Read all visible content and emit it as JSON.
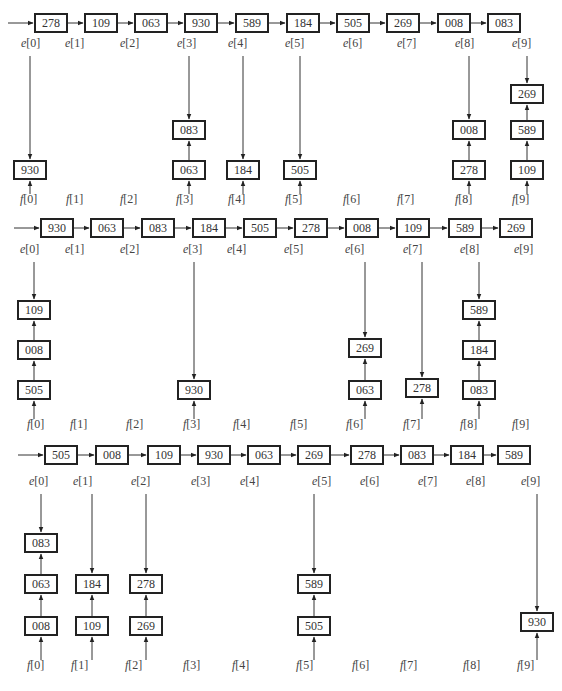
{
  "passes": [
    {
      "list": [
        "278",
        "109",
        "063",
        "930",
        "589",
        "184",
        "505",
        "269",
        "008",
        "083"
      ],
      "list_x": [
        34,
        84,
        134,
        184,
        235,
        286,
        336,
        386,
        437,
        487
      ],
      "list_y": 13,
      "e_label_x": [
        21,
        65,
        120,
        177,
        228,
        285,
        343,
        397,
        455,
        512
      ],
      "e_label_y": 36,
      "e_labels": [
        "e[0]",
        "e[1]",
        "e[2]",
        "e[3]",
        "e[4]",
        "e[5]",
        "e[6]",
        "e[7]",
        "e[8]",
        "e[9]"
      ],
      "f_labels": [
        "f[0]",
        "f[1]",
        "f[2]",
        "f[3]",
        "f[4]",
        "f[5]",
        "f[6]",
        "f[7]",
        "f[8]",
        "f[9]"
      ],
      "f_label_x": [
        20,
        66,
        120,
        176,
        228,
        285,
        343,
        397,
        455,
        512
      ],
      "f_label_y": 192,
      "buckets": [
        {
          "col": 0,
          "x": 13,
          "items": [
            {
              "v": "930",
              "y": 160
            }
          ]
        },
        {
          "col": 3,
          "x": 172,
          "items": [
            {
              "v": "063",
              "y": 160
            },
            {
              "v": "083",
              "y": 120
            }
          ]
        },
        {
          "col": 4,
          "x": 226,
          "items": [
            {
              "v": "184",
              "y": 160
            }
          ]
        },
        {
          "col": 5,
          "x": 283,
          "items": [
            {
              "v": "505",
              "y": 160
            }
          ]
        },
        {
          "col": 8,
          "x": 452,
          "items": [
            {
              "v": "278",
              "y": 160
            },
            {
              "v": "008",
              "y": 120
            }
          ]
        },
        {
          "col": 9,
          "x": 510,
          "items": [
            {
              "v": "109",
              "y": 160
            },
            {
              "v": "589",
              "y": 120
            },
            {
              "v": "269",
              "y": 84
            }
          ]
        }
      ]
    },
    {
      "list": [
        "930",
        "063",
        "083",
        "184",
        "505",
        "278",
        "008",
        "109",
        "589",
        "269"
      ],
      "list_x": [
        40,
        90,
        141,
        192,
        243,
        294,
        345,
        396,
        448,
        499
      ],
      "list_y": 218,
      "e_label_x": [
        20,
        65,
        120,
        183,
        227,
        284,
        345,
        403,
        460,
        514
      ],
      "e_label_y": 242,
      "e_labels": [
        "e[0]",
        "e[1]",
        "e[2]",
        "e[3]",
        "e[4]",
        "e[5]",
        "e[6]",
        "e[7]",
        "e[8]",
        "e[9]"
      ],
      "f_labels": [
        "f[0]",
        "f[1]",
        "f[2]",
        "f[3]",
        "f[4]",
        "f[5]",
        "f[6]",
        "f[7]",
        "f[8]",
        "f[9]"
      ],
      "f_label_x": [
        27,
        70,
        126,
        183,
        233,
        290,
        346,
        403,
        460,
        512
      ],
      "f_label_y": 417,
      "buckets": [
        {
          "col": 0,
          "x": 17,
          "items": [
            {
              "v": "505",
              "y": 380
            },
            {
              "v": "008",
              "y": 340
            },
            {
              "v": "109",
              "y": 300
            }
          ]
        },
        {
          "col": 3,
          "x": 177,
          "items": [
            {
              "v": "930",
              "y": 380
            }
          ]
        },
        {
          "col": 6,
          "x": 348,
          "items": [
            {
              "v": "063",
              "y": 380
            },
            {
              "v": "269",
              "y": 338
            }
          ]
        },
        {
          "col": 7,
          "x": 405,
          "items": [
            {
              "v": "278",
              "y": 378
            }
          ]
        },
        {
          "col": 8,
          "x": 462,
          "items": [
            {
              "v": "083",
              "y": 380
            },
            {
              "v": "184",
              "y": 340
            },
            {
              "v": "589",
              "y": 300
            }
          ]
        }
      ]
    },
    {
      "list": [
        "505",
        "008",
        "109",
        "930",
        "063",
        "269",
        "278",
        "083",
        "184",
        "589"
      ],
      "list_x": [
        44,
        95,
        147,
        197,
        247,
        297,
        350,
        400,
        450,
        497
      ],
      "list_y": 445,
      "e_label_x": [
        29,
        73,
        131,
        191,
        240,
        312,
        360,
        418,
        466,
        521
      ],
      "e_label_y": 474,
      "e_labels": [
        "e[0]",
        "e[1]",
        "e[2]",
        "e[3]",
        "e[4]",
        "e[5]",
        "e[6]",
        "e[7]",
        "e[8]",
        "e[9]"
      ],
      "f_labels": [
        "f[0]",
        "f[1]",
        "f[2]",
        "f[3]",
        "f[4]",
        "f[5]",
        "f[6]",
        "f[7]",
        "f[8]",
        "f[9]"
      ],
      "f_label_x": [
        27,
        71,
        125,
        183,
        232,
        296,
        352,
        400,
        463,
        517
      ],
      "f_label_y": 658,
      "buckets": [
        {
          "col": 0,
          "x": 24,
          "items": [
            {
              "v": "008",
              "y": 616
            },
            {
              "v": "063",
              "y": 574
            },
            {
              "v": "083",
              "y": 533
            }
          ]
        },
        {
          "col": 1,
          "x": 75,
          "items": [
            {
              "v": "109",
              "y": 616
            },
            {
              "v": "184",
              "y": 574
            }
          ]
        },
        {
          "col": 2,
          "x": 129,
          "items": [
            {
              "v": "269",
              "y": 616
            },
            {
              "v": "278",
              "y": 574
            }
          ]
        },
        {
          "col": 5,
          "x": 297,
          "items": [
            {
              "v": "505",
              "y": 616
            },
            {
              "v": "589",
              "y": 574
            }
          ]
        },
        {
          "col": 9,
          "x": 520,
          "items": [
            {
              "v": "930",
              "y": 612
            }
          ]
        }
      ]
    }
  ],
  "colors": {
    "line": "#333333",
    "box_border": "#222222",
    "text": "#333333"
  }
}
